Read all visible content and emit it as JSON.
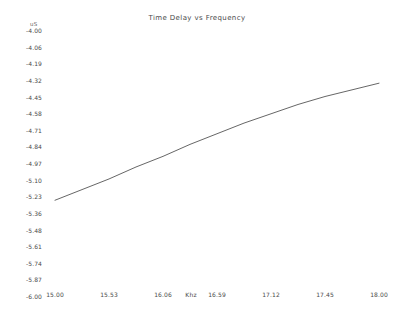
{
  "chart_data": {
    "type": "line",
    "title": "Time Delay vs Frequency",
    "xlabel": "Khz",
    "ylabel": "uS",
    "xlim": [
      15.0,
      18.0
    ],
    "ylim": [
      -6.0,
      -4.0
    ],
    "grid": false,
    "legend": null,
    "x_ticks": [
      "15.00",
      "15.53",
      "16.06",
      "16.59",
      "17.12",
      "17.45",
      "18.00"
    ],
    "x_tick_values": [
      15.0,
      15.53,
      16.06,
      16.59,
      17.12,
      17.45,
      18.0
    ],
    "y_ticks": [
      "-4.00",
      "-4.06",
      "-4.19",
      "-4.32",
      "-4.45",
      "-4.58",
      "-4.71",
      "-4.84",
      "-4.97",
      "-5.10",
      "-5.23",
      "-5.36",
      "-5.48",
      "-5.61",
      "-5.74",
      "-5.87",
      "-6.00"
    ],
    "y_tick_values": [
      -4.0,
      -4.06,
      -4.19,
      -4.32,
      -4.45,
      -4.58,
      -4.71,
      -4.84,
      -4.97,
      -5.1,
      -5.23,
      -5.36,
      -5.48,
      -5.61,
      -5.74,
      -5.87,
      -6.0
    ],
    "line_color": "#4a4a4a",
    "series": [
      {
        "name": "Time Delay",
        "x": [
          15.0,
          15.25,
          15.5,
          15.75,
          16.0,
          16.25,
          16.5,
          16.75,
          17.0,
          17.25,
          17.5,
          17.75,
          18.0
        ],
        "values": [
          -5.28,
          -5.2,
          -5.12,
          -5.03,
          -4.95,
          -4.86,
          -4.78,
          -4.7,
          -4.63,
          -4.56,
          -4.5,
          -4.45,
          -4.4
        ]
      }
    ]
  }
}
